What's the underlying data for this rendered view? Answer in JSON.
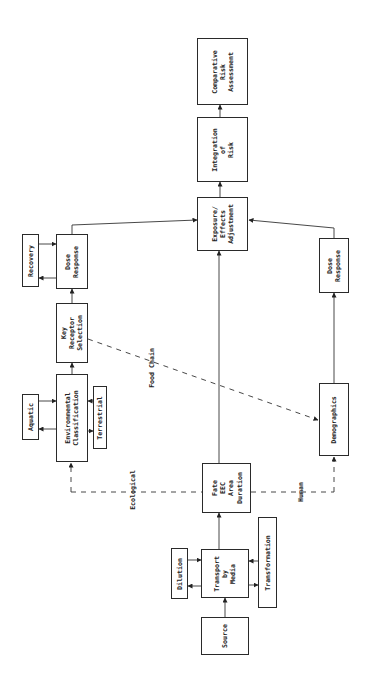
{
  "diagram": {
    "orientation": "rotated-90-ccw",
    "nodes": {
      "source": "Source",
      "transport": "Transport\nby\nMedia",
      "dilution": "Dilution",
      "transformation": "Transformation",
      "fate": "Fate\nEEC\nArea\nDuration",
      "environmental_classification": "Environmental\nClassification",
      "aquatic": "Aquatic",
      "terrestrial": "Terrestrial",
      "key_receptor": "Key\nReceptor\nSelection",
      "dose_response_eco": "Dose\nResponse",
      "recovery": "Recovery",
      "demographics": "Demographics",
      "dose_response_human": "Dose\nResponse",
      "exposure_effects": "Exposure/\nEffects\nAdjustment",
      "integration": "Integration\nof\nRisk",
      "comparative": "Comparative\nRisk\nAssessment"
    },
    "edge_labels": {
      "ecological": "Ecological",
      "human": "Human",
      "food_chain": "Food Chain"
    }
  }
}
